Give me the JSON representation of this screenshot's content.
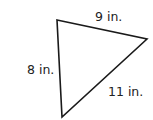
{
  "diagram": {
    "shape": "triangle",
    "sides": [
      {
        "id": "top",
        "label": "9 in."
      },
      {
        "id": "left",
        "label": "8 in."
      },
      {
        "id": "right",
        "label": "11 in."
      }
    ],
    "vertices": [
      [
        57,
        20
      ],
      [
        147,
        39
      ],
      [
        62,
        117
      ]
    ],
    "stroke_color": "#1a1a1a"
  }
}
